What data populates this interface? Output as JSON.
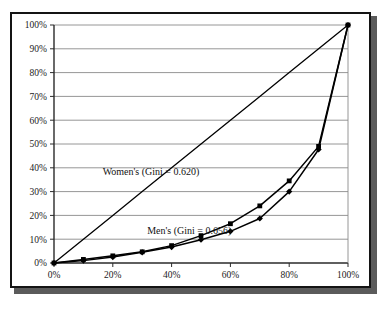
{
  "figure": {
    "clipped_caption_text": "··· ··",
    "frame_color": "#141414",
    "shadow_color": "#5b5b5b",
    "background": "#ffffff"
  },
  "chart_data": {
    "type": "line",
    "title": "",
    "subtitle": "",
    "xlabel": "",
    "ylabel": "",
    "xlim": [
      0,
      100
    ],
    "ylim": [
      0,
      100
    ],
    "grid": "horizontal",
    "legend_position": "inline-annotations",
    "x_tick_labels": [
      "0%",
      "20%",
      "40%",
      "60%",
      "80%",
      "100%"
    ],
    "x_ticks": [
      0,
      20,
      40,
      60,
      80,
      100
    ],
    "y_tick_labels": [
      "0%",
      "10%",
      "20%",
      "30%",
      "40%",
      "50%",
      "60%",
      "70%",
      "80%",
      "90%",
      "100%"
    ],
    "y_ticks": [
      0,
      10,
      20,
      30,
      40,
      50,
      60,
      70,
      80,
      90,
      100
    ],
    "x": [
      0,
      10,
      20,
      30,
      40,
      50,
      60,
      70,
      80,
      90,
      100
    ],
    "series": [
      {
        "name": "Women's (Gini = 0.620)",
        "annotation": "Women's (Gini = 0.620)",
        "gini": 0.62,
        "color": "#000000",
        "marker": "square",
        "values": [
          0,
          1.5,
          3.0,
          4.7,
          7.3,
          11.5,
          16.5,
          24.0,
          34.5,
          49.0,
          100
        ]
      },
      {
        "name": "Men's (Gini = 0.656)",
        "annotation": "Men's (Gini = 0.656)",
        "gini": 0.656,
        "color": "#000000",
        "marker": "diamond",
        "values": [
          0,
          1.0,
          2.5,
          4.5,
          6.7,
          9.8,
          13.3,
          18.7,
          30.0,
          47.7,
          100
        ]
      },
      {
        "name": "Line of equality",
        "annotation": "",
        "color": "#000000",
        "marker": "none",
        "values": [
          0,
          10,
          20,
          30,
          40,
          50,
          60,
          70,
          80,
          90,
          100
        ]
      }
    ],
    "annotations": [
      {
        "text": "Women's (Gini = 0.620)",
        "x": 33,
        "y": 37
      },
      {
        "text": "Men's (Gini = 0.656)",
        "x": 46,
        "y": 12
      }
    ]
  }
}
